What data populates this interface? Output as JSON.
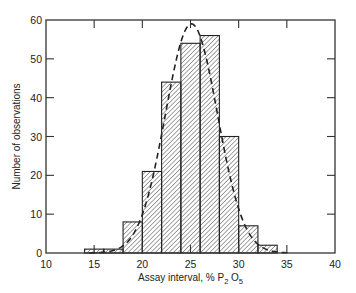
{
  "chart_data": {
    "type": "bar",
    "subtype": "histogram",
    "title": "",
    "xlabel": "Assay interval, % P2O5",
    "xlabel_parts": {
      "prefix": "Assay interval, % P",
      "sub1": "2",
      "mid": "O",
      "sub2": "5"
    },
    "ylabel": "Number of observations",
    "xlim": [
      10,
      40
    ],
    "ylim": [
      0,
      60
    ],
    "xticks": [
      10,
      15,
      20,
      25,
      30,
      35,
      40
    ],
    "yticks": [
      0,
      10,
      20,
      30,
      40,
      50,
      60
    ],
    "grid": false,
    "legend": null,
    "bin_width": 2,
    "bins": [
      {
        "from": 14,
        "to": 16,
        "count": 1
      },
      {
        "from": 16,
        "to": 18,
        "count": 1
      },
      {
        "from": 18,
        "to": 20,
        "count": 8
      },
      {
        "from": 20,
        "to": 22,
        "count": 21
      },
      {
        "from": 22,
        "to": 24,
        "count": 44
      },
      {
        "from": 24,
        "to": 26,
        "count": 54
      },
      {
        "from": 26,
        "to": 28,
        "count": 56
      },
      {
        "from": 28,
        "to": 30,
        "count": 30
      },
      {
        "from": 30,
        "to": 32,
        "count": 7
      },
      {
        "from": 32,
        "to": 34,
        "count": 2
      }
    ],
    "categories": [
      "14-16",
      "16-18",
      "18-20",
      "20-22",
      "22-24",
      "24-26",
      "26-28",
      "28-30",
      "30-32",
      "32-34"
    ],
    "values": [
      1,
      1,
      8,
      21,
      44,
      54,
      56,
      30,
      7,
      2
    ],
    "fitted_curve": {
      "type": "normal",
      "style": "dashed",
      "mean": 25.1,
      "peak": 59,
      "sd": 2.7
    },
    "bar_fill": "diagonal-hatch",
    "colors": {
      "ink": "#222222",
      "background": "#ffffff"
    }
  }
}
